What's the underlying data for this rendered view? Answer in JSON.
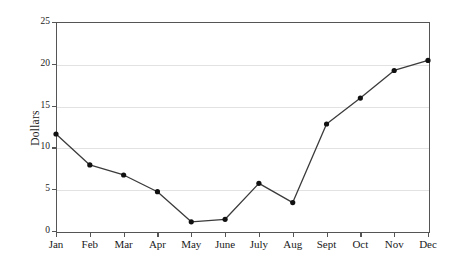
{
  "chart_data": {
    "type": "line",
    "title": "",
    "xlabel": "",
    "ylabel": "Dollars",
    "categories": [
      "Jan",
      "Feb",
      "Mar",
      "Apr",
      "May",
      "June",
      "July",
      "Aug",
      "Sept",
      "Oct",
      "Nov",
      "Dec"
    ],
    "values": [
      11.6,
      7.9,
      6.7,
      4.7,
      1.1,
      1.4,
      5.7,
      3.4,
      12.8,
      15.9,
      19.2,
      20.4
    ],
    "series": [
      {
        "name": "Dollars",
        "values": [
          11.6,
          7.9,
          6.7,
          4.7,
          1.1,
          1.4,
          5.7,
          3.4,
          12.8,
          15.9,
          19.2,
          20.4
        ]
      }
    ],
    "ylim": [
      0,
      25
    ],
    "ytick_labels": [
      "0",
      "5",
      "10",
      "15",
      "20",
      "25"
    ],
    "ytick_values": [
      0,
      5,
      10,
      15,
      20,
      25
    ],
    "grid": true,
    "grid_axis": "y",
    "legend": false,
    "legend_position": "none",
    "marker": "circle",
    "colors": {
      "line": "#3b3b3b",
      "marker": "#111111",
      "grid": "#e2e2e2",
      "axis": "#555555",
      "background": "#ffffff",
      "text": "#1a1a1a"
    }
  }
}
